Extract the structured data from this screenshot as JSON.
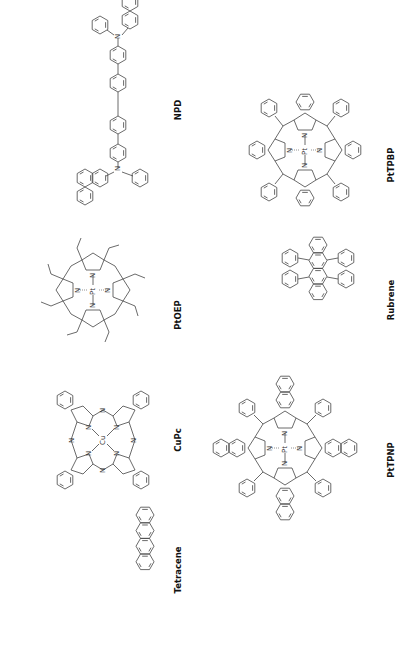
{
  "figure": {
    "background": "#ffffff",
    "ink_color": "#333333",
    "orientation": "rotated -90deg (labels read bottom-to-top)",
    "molecules": [
      {
        "id": "npd",
        "label": "NPD",
        "atoms": [
          "N",
          "N"
        ]
      },
      {
        "id": "ptoep",
        "label": "PtOEP",
        "atoms": [
          "N",
          "N",
          "N",
          "N",
          "Pt"
        ]
      },
      {
        "id": "cupc",
        "label": "CuPc",
        "atoms": [
          "N",
          "N",
          "N",
          "N",
          "N",
          "N",
          "N",
          "N",
          "Cu"
        ]
      },
      {
        "id": "tetracene",
        "label": "Tetracene",
        "atoms": []
      },
      {
        "id": "pttpbp",
        "label": "PtTPBP",
        "atoms": [
          "N",
          "N",
          "N",
          "N",
          "Pt"
        ]
      },
      {
        "id": "rubrene",
        "label": "Rubrene",
        "atoms": []
      },
      {
        "id": "pttpnp",
        "label": "PtTPNP",
        "atoms": [
          "N",
          "N",
          "N",
          "N",
          "Pt"
        ]
      }
    ]
  }
}
